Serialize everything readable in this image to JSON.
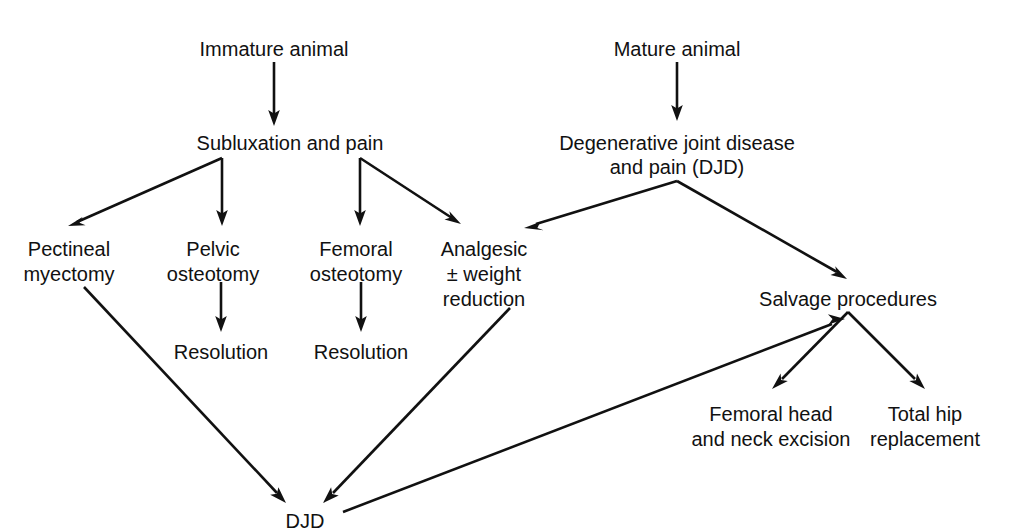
{
  "diagram": {
    "background_color": "#ffffff",
    "line_color": "#111111",
    "text_color": "#111111",
    "nodes": [
      {
        "id": "immature_animal",
        "label": "Immature animal",
        "lines": [
          "Immature animal"
        ],
        "x": 274,
        "y": 49
      },
      {
        "id": "mature_animal",
        "label": "Mature animal",
        "lines": [
          "Mature animal"
        ],
        "x": 677,
        "y": 49
      },
      {
        "id": "subluxation_pain",
        "label": "Subluxation and pain",
        "lines": [
          "Subluxation and pain"
        ],
        "x": 290,
        "y": 143
      },
      {
        "id": "djd_top",
        "label": "Degenerative joint disease and pain (DJD)",
        "lines": [
          "Degenerative joint disease",
          "and pain (DJD)"
        ],
        "x": 677,
        "y": 143
      },
      {
        "id": "pectineal_myectomy",
        "label": "Pectineal myectomy",
        "lines": [
          "Pectineal",
          "myectomy"
        ],
        "x": 69,
        "y": 249
      },
      {
        "id": "pelvic_osteotomy",
        "label": "Pelvic osteotomy",
        "lines": [
          "Pelvic",
          "osteotomy"
        ],
        "x": 214,
        "y": 249
      },
      {
        "id": "femoral_osteotomy",
        "label": "Femoral osteotomy",
        "lines": [
          "Femoral",
          "osteotomy"
        ],
        "x": 357,
        "y": 249
      },
      {
        "id": "analgesic_weight_reduction",
        "label": "Analgesic ± weight reduction",
        "lines": [
          "Analgesic",
          "± weight",
          "reduction"
        ],
        "x": 484,
        "y": 249
      },
      {
        "id": "resolution_left",
        "label": "Resolution",
        "lines": [
          "Resolution"
        ],
        "x": 221,
        "y": 352
      },
      {
        "id": "resolution_right",
        "label": "Resolution",
        "lines": [
          "Resolution"
        ],
        "x": 361,
        "y": 352
      },
      {
        "id": "salvage_procedures",
        "label": "Salvage procedures",
        "lines": [
          "Salvage procedures"
        ],
        "x": 848,
        "y": 299
      },
      {
        "id": "femoral_head_neck_excision",
        "label": "Femoral head and neck excision",
        "lines": [
          "Femoral head",
          "and neck excision"
        ],
        "x": 771,
        "y": 414
      },
      {
        "id": "total_hip_replacement",
        "label": "Total hip replacement",
        "lines": [
          "Total hip",
          "replacement"
        ],
        "x": 925,
        "y": 414
      },
      {
        "id": "djd_bottom",
        "label": "DJD",
        "lines": [
          "DJD"
        ],
        "x": 305,
        "y": 521
      }
    ],
    "edges": [
      {
        "id": "immature-to-subluxation",
        "from": "immature_animal",
        "to": "subluxation_pain",
        "kind": "arrow"
      },
      {
        "id": "mature-to-djd",
        "from": "mature_animal",
        "to": "djd_top",
        "kind": "arrow"
      },
      {
        "id": "subluxation-to-pectineal",
        "from": "subluxation_pain",
        "to": "pectineal_myectomy",
        "kind": "arrow"
      },
      {
        "id": "subluxation-to-pelvic",
        "from": "subluxation_pain",
        "to": "pelvic_osteotomy",
        "kind": "arrow"
      },
      {
        "id": "subluxation-to-femoral",
        "from": "subluxation_pain",
        "to": "femoral_osteotomy",
        "kind": "arrow"
      },
      {
        "id": "subluxation-to-analgesic",
        "from": "subluxation_pain",
        "to": "analgesic_weight_reduction",
        "kind": "arrow"
      },
      {
        "id": "djdtop-to-analgesic",
        "from": "djd_top",
        "to": "analgesic_weight_reduction",
        "kind": "arrow"
      },
      {
        "id": "djdtop-to-salvage",
        "from": "djd_top",
        "to": "salvage_procedures",
        "kind": "arrow"
      },
      {
        "id": "pelvic-to-resolution",
        "from": "pelvic_osteotomy",
        "to": "resolution_left",
        "kind": "arrow"
      },
      {
        "id": "femoral-to-resolution",
        "from": "femoral_osteotomy",
        "to": "resolution_right",
        "kind": "arrow"
      },
      {
        "id": "pectineal-to-djdbottom",
        "from": "pectineal_myectomy",
        "to": "djd_bottom",
        "kind": "arrow"
      },
      {
        "id": "analgesic-to-djdbottom",
        "from": "analgesic_weight_reduction",
        "to": "djd_bottom",
        "kind": "arrow"
      },
      {
        "id": "djdbottom-to-salvage",
        "from": "djd_bottom",
        "to": "salvage_procedures",
        "kind": "arrow"
      },
      {
        "id": "salvage-to-femoralhead",
        "from": "salvage_procedures",
        "to": "femoral_head_neck_excision",
        "kind": "arrow"
      },
      {
        "id": "salvage-to-totalhip",
        "from": "salvage_procedures",
        "to": "total_hip_replacement",
        "kind": "arrow"
      }
    ]
  },
  "labels": {
    "immature_animal": "Immature animal",
    "mature_animal": "Mature animal",
    "subluxation_pain": "Subluxation and pain",
    "djd_top_line1": "Degenerative joint disease",
    "djd_top_line2": "and pain (DJD)",
    "pectineal_line1": "Pectineal",
    "pectineal_line2": "myectomy",
    "pelvic_line1": "Pelvic",
    "pelvic_line2": "osteotomy",
    "femoral_line1": "Femoral",
    "femoral_line2": "osteotomy",
    "analgesic_line1": "Analgesic",
    "analgesic_line2": "± weight",
    "analgesic_line3": "reduction",
    "resolution_left": "Resolution",
    "resolution_right": "Resolution",
    "salvage_procedures": "Salvage procedures",
    "femoral_head_line1": "Femoral head",
    "femoral_head_line2": "and neck excision",
    "total_hip_line1": "Total hip",
    "total_hip_line2": "replacement",
    "djd_bottom": "DJD"
  }
}
